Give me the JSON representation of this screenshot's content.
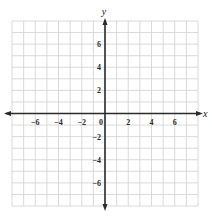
{
  "chart_data": {
    "type": "scatter",
    "title": "",
    "xlabel": "x",
    "ylabel": "y",
    "xlim": [
      -8,
      8
    ],
    "ylim": [
      -8,
      8
    ],
    "grid": true,
    "grid_step": 1,
    "x_ticks": [
      -6,
      -4,
      -2,
      0,
      2,
      4,
      6
    ],
    "y_ticks": [
      6,
      4,
      2,
      -2,
      -4,
      -6
    ],
    "x_tick_labels": [
      "−6",
      "−4",
      "−2",
      "0",
      "2",
      "4",
      "6"
    ],
    "y_tick_labels": [
      "6",
      "4",
      "2",
      "−2",
      "−4",
      "−6"
    ],
    "series": [],
    "colors": {
      "grid": "#d0d0d0",
      "axis": "#2b2b2b"
    }
  }
}
